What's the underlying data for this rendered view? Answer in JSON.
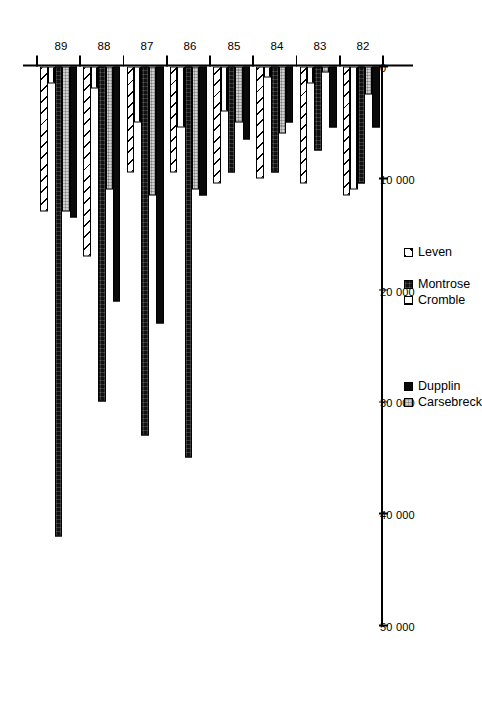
{
  "chart_data": {
    "type": "bar",
    "orientation": "horizontal",
    "title": "",
    "xlabel": "",
    "ylabel": "",
    "categories": [
      "82",
      "83",
      "84",
      "85",
      "86",
      "87",
      "88",
      "89"
    ],
    "value_axis": {
      "min": 0,
      "max": 50000,
      "ticks": [
        0,
        10000,
        20000,
        30000,
        40000,
        50000
      ],
      "tick_labels": [
        "0",
        "10 000",
        "20 000",
        "30 000",
        "40 000",
        "50 000"
      ],
      "grid": false
    },
    "legend": {
      "position": "right-inside",
      "entries": [
        "Dupplin",
        "Carsebreck",
        "Montrose",
        "Cromble",
        "Leven"
      ]
    },
    "series": [
      {
        "name": "Dupplin",
        "pattern": "solid-black",
        "values": [
          5500,
          5500,
          5000,
          6500,
          11500,
          23000,
          21000,
          13500
        ]
      },
      {
        "name": "Carsebreck",
        "pattern": "light-grey-stipple",
        "values": [
          2500,
          500,
          6000,
          5000,
          11000,
          11500,
          11000,
          13000
        ]
      },
      {
        "name": "Montrose",
        "pattern": "dark-dense",
        "values": [
          10500,
          7500,
          9500,
          9500,
          35000,
          33000,
          30000,
          42000
        ]
      },
      {
        "name": "Cromble",
        "pattern": "vertical-stripes",
        "values": [
          11000,
          1500,
          1000,
          4000,
          5500,
          5000,
          2000,
          1500
        ]
      },
      {
        "name": "Leven",
        "pattern": "diagonal-hatch",
        "values": [
          11500,
          10500,
          10000,
          10500,
          9500,
          9500,
          17000,
          13000
        ]
      }
    ]
  },
  "legend_groups": {
    "group_a": [
      {
        "label": "Dupplin",
        "pattern": "solid-black"
      },
      {
        "label": "Carsebreck",
        "pattern": "light-grey-stipple"
      }
    ],
    "group_b": [
      {
        "label": "Montrose",
        "pattern": "dark-dense"
      },
      {
        "label": "Cromble",
        "pattern": "vertical-stripes"
      }
    ],
    "group_c": [
      {
        "label": "Leven",
        "pattern": "diagonal-hatch"
      }
    ]
  },
  "colors": {
    "axis": "#000000",
    "dupplin": "#0a0a0a",
    "carsebreck": "#cfcfcf",
    "montrose": "#111111",
    "cromble": "#ffffff",
    "leven": "#ffffff",
    "background": "#ffffff"
  }
}
